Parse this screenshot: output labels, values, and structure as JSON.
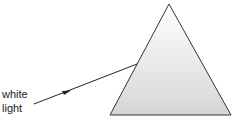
{
  "diagram": {
    "labels": {
      "line1": "white",
      "line2": "light"
    },
    "prism": {
      "shape": "triangle",
      "points": [
        [
          169,
          4
        ],
        [
          110,
          115
        ],
        [
          231,
          115
        ]
      ],
      "fill_top": "#ffffff",
      "fill_bottom": "#d8d8d8",
      "stroke": "#333333"
    },
    "ray": {
      "from": [
        34,
        104
      ],
      "to": [
        137,
        64
      ],
      "arrow_at": [
        67,
        91
      ],
      "color": "#222222"
    }
  }
}
